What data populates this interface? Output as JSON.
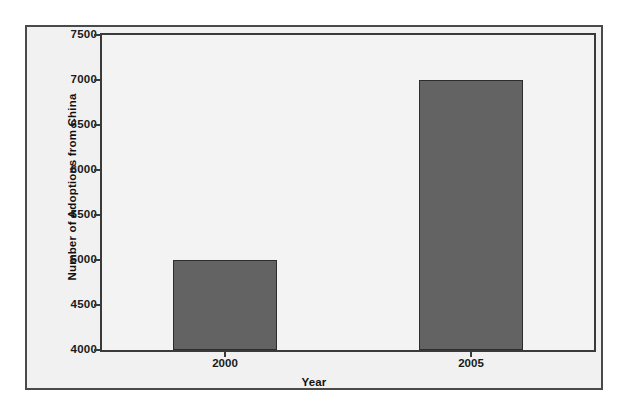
{
  "chart_data": {
    "type": "bar",
    "title": "",
    "subtitle": "",
    "categories": [
      "2000",
      "2005"
    ],
    "values": [
      5000,
      7000
    ],
    "series": [
      {
        "name": "Number of Adoptions from China",
        "values": [
          5000,
          7000
        ]
      }
    ],
    "xlabel": "Year",
    "ylabel": "Number of Adoptions from China",
    "ylim": [
      4000,
      7500
    ],
    "yticks": [
      4000,
      4500,
      5000,
      5500,
      6000,
      6500,
      7000,
      7500
    ],
    "ytick_labels": [
      "4000",
      "4500",
      "5000",
      "5500",
      "6000",
      "6500",
      "7000",
      "7500"
    ],
    "xtick_labels": [
      "2000",
      "2005"
    ],
    "grid": false,
    "legend": false,
    "legend_position": "none",
    "bar_color": "#636363",
    "bar_edge_color": "#2d2d2d",
    "plot_background": "#f3f3f3",
    "figure_background": "#f1f1f1",
    "axis_color": "#3a3a3a",
    "text_color": "#1a1a1a"
  }
}
